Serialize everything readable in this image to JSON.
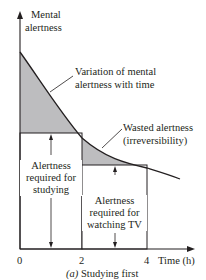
{
  "diagram": {
    "y_axis_label_line1": "Mental",
    "y_axis_label_line2": "alertness",
    "x_axis_label": "Time (h)",
    "x_ticks": [
      "0",
      "2",
      "4"
    ],
    "annotation_curve_line1": "Variation of mental",
    "annotation_curve_line2": "alertness with time",
    "annotation_wasted_line1": "Wasted alertness",
    "annotation_wasted_line2": "(irreversibility)",
    "box1_line1": "Alertness",
    "box1_line2": "required for",
    "box1_line3": "studying",
    "box2_line1": "Alertness",
    "box2_line2": "required for",
    "box2_line3": "watching TV",
    "caption_letter": "(a)",
    "caption_text": "Studying first",
    "colors": {
      "shading": "#bdbdbf",
      "line": "#231f20",
      "background": "#ffffff"
    }
  }
}
